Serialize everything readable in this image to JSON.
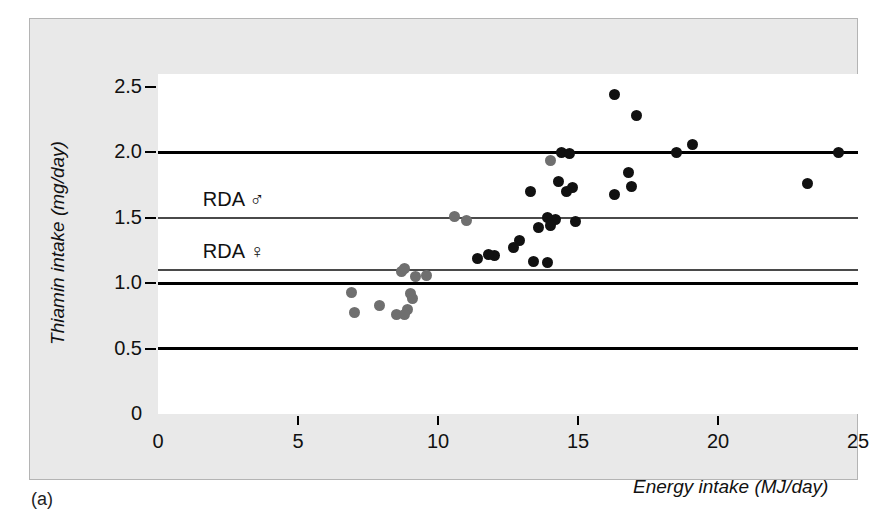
{
  "figure": {
    "caption": "(a)",
    "background_color": "#e9e9e9",
    "plot_background_color": "#ffffff",
    "male_color": "#111111",
    "female_color": "#6f6f6f"
  },
  "chart_data": {
    "type": "scatter",
    "title": "",
    "xlabel": "Energy intake (MJ/day)",
    "ylabel": "Thiamin intake (mg/day)",
    "xlim": [
      0,
      25
    ],
    "ylim": [
      0,
      2.6
    ],
    "xticks": [
      0,
      5,
      10,
      15,
      20,
      25
    ],
    "xtick_labels": [
      "0",
      "5",
      "10",
      "15",
      "20",
      "25"
    ],
    "yticks": [
      0,
      0.5,
      1.0,
      1.5,
      2.0,
      2.5
    ],
    "ytick_labels": [
      "0",
      "0.5",
      "1.0",
      "1.5",
      "2.0",
      "2.5"
    ],
    "grid": false,
    "legend_position": "none",
    "reference_lines": [
      {
        "name": "rda-male",
        "label": "RDA ♂",
        "y": 1.5,
        "style": "thin",
        "label_x": 1.6,
        "label_y": 1.62
      },
      {
        "name": "rda-female",
        "label": "RDA ♀",
        "y": 1.1,
        "style": "thin",
        "label_x": 1.6,
        "label_y": 1.22
      },
      {
        "name": "line-2-0",
        "label": "",
        "y": 2.0,
        "style": "thick"
      },
      {
        "name": "line-1-0",
        "label": "",
        "y": 1.0,
        "style": "thick"
      },
      {
        "name": "line-0-5",
        "label": "",
        "y": 0.5,
        "style": "thick"
      }
    ],
    "series": [
      {
        "name": "Men",
        "marker": "filled-circle",
        "color": "#111111",
        "points": [
          [
            16.3,
            2.44
          ],
          [
            17.1,
            2.28
          ],
          [
            19.1,
            2.06
          ],
          [
            18.5,
            2.0
          ],
          [
            24.3,
            2.0
          ],
          [
            14.4,
            2.0
          ],
          [
            14.7,
            1.99
          ],
          [
            16.8,
            1.85
          ],
          [
            23.2,
            1.76
          ],
          [
            16.9,
            1.74
          ],
          [
            14.8,
            1.73
          ],
          [
            14.3,
            1.78
          ],
          [
            13.3,
            1.7
          ],
          [
            16.3,
            1.68
          ],
          [
            14.6,
            1.7
          ],
          [
            14.9,
            1.47
          ],
          [
            14.2,
            1.49
          ],
          [
            13.9,
            1.5
          ],
          [
            14.0,
            1.44
          ],
          [
            13.6,
            1.43
          ],
          [
            12.9,
            1.33
          ],
          [
            12.7,
            1.27
          ],
          [
            12.0,
            1.21
          ],
          [
            11.4,
            1.19
          ],
          [
            11.8,
            1.22
          ],
          [
            13.4,
            1.17
          ],
          [
            13.9,
            1.16
          ]
        ]
      },
      {
        "name": "Women",
        "marker": "filled-circle",
        "color": "#6f6f6f",
        "points": [
          [
            10.6,
            1.51
          ],
          [
            11.0,
            1.48
          ],
          [
            14.0,
            1.94
          ],
          [
            9.6,
            1.06
          ],
          [
            8.7,
            1.09
          ],
          [
            8.8,
            1.11
          ],
          [
            9.2,
            1.05
          ],
          [
            6.9,
            0.93
          ],
          [
            9.0,
            0.92
          ],
          [
            9.1,
            0.88
          ],
          [
            7.9,
            0.83
          ],
          [
            8.9,
            0.8
          ],
          [
            7.0,
            0.78
          ],
          [
            8.5,
            0.76
          ],
          [
            8.8,
            0.76
          ]
        ]
      }
    ]
  }
}
